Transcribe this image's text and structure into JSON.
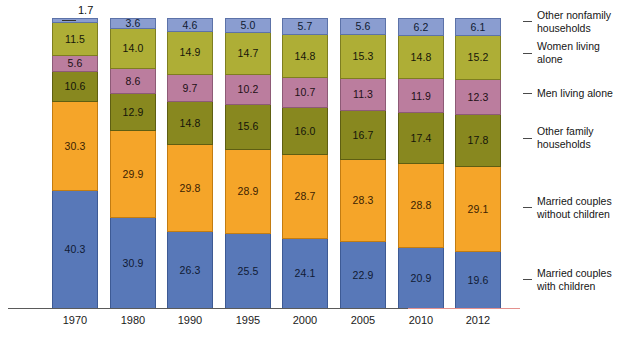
{
  "chart_data": {
    "type": "bar",
    "subtype": "stacked-bar-100",
    "title": "",
    "subtitle": "",
    "xlabel": "",
    "ylabel": "",
    "ylim": [
      0,
      100
    ],
    "grid": false,
    "legend_position": "right",
    "categories": [
      "1970",
      "1980",
      "1990",
      "1995",
      "2000",
      "2005",
      "2010",
      "2012"
    ],
    "series": [
      {
        "name": "Married couples with children",
        "color": "#5878b8",
        "values": [
          40.3,
          30.9,
          26.3,
          25.5,
          24.1,
          22.9,
          20.9,
          19.6
        ]
      },
      {
        "name": "Married couples without children",
        "color": "#f5a529",
        "values": [
          30.3,
          29.9,
          29.8,
          28.9,
          28.7,
          28.3,
          28.8,
          29.1
        ]
      },
      {
        "name": "Other family households",
        "color": "#88881f",
        "values": [
          10.6,
          12.9,
          14.8,
          15.6,
          16.0,
          16.7,
          17.4,
          17.8
        ]
      },
      {
        "name": "Men living alone",
        "color": "#bb7d9e",
        "values": [
          5.6,
          8.6,
          9.7,
          10.2,
          10.7,
          11.3,
          11.9,
          12.3
        ]
      },
      {
        "name": "Women living alone",
        "color": "#aeae36",
        "values": [
          11.5,
          14.0,
          14.9,
          14.7,
          14.8,
          15.3,
          14.8,
          15.2
        ]
      },
      {
        "name": "Other nonfamily households",
        "color": "#8a9dd0",
        "values": [
          1.7,
          3.6,
          4.6,
          5.0,
          5.7,
          5.6,
          6.2,
          6.1
        ]
      }
    ],
    "annotations": [
      {
        "text": "1.7",
        "note": "callout label for the 1970 Other nonfamily households slice"
      }
    ]
  },
  "legend": {
    "items": [
      {
        "label_line1": "Other nonfamily",
        "label_line2": "households"
      },
      {
        "label_line1": "Women living",
        "label_line2": "alone"
      },
      {
        "label_line1": "Men living alone",
        "label_line2": ""
      },
      {
        "label_line1": "Other family",
        "label_line2": "households"
      },
      {
        "label_line1": "Married couples",
        "label_line2": "without children"
      },
      {
        "label_line1": "Married couples",
        "label_line2": "with children"
      }
    ]
  },
  "axis": {
    "tick_labels": [
      "1970",
      "1980",
      "1990",
      "1995",
      "2000",
      "2005",
      "2010",
      "2012"
    ]
  }
}
